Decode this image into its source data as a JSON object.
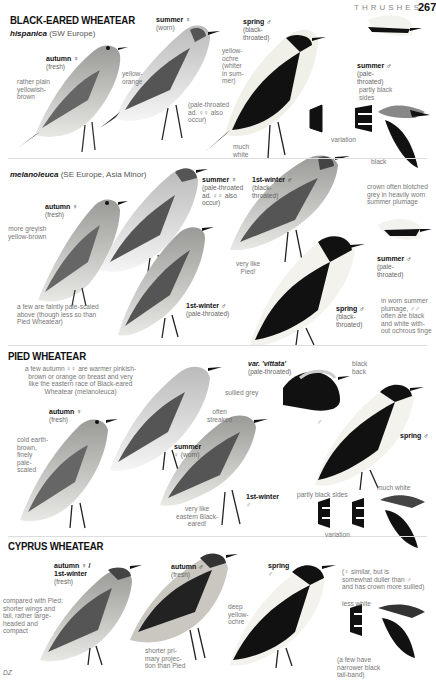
{
  "header": {
    "chapter": "THRUSHES",
    "page_number": "267"
  },
  "colors": {
    "text_dark": "#111111",
    "text_grey": "#777777",
    "female_symbol": "#cc7777",
    "rule": "#dddddd"
  },
  "sections": [
    {
      "title": "BLACK-EARED WHEATEAR",
      "races": [
        {
          "name": "hispanica",
          "range": "(SW Europe)",
          "labels": {
            "autumn_f": {
              "title": "autumn ♀",
              "sub": "(fresh)"
            },
            "summer_f": {
              "title": "summer ♀",
              "sub": "(worn)"
            },
            "spring_m": {
              "title": "spring ♂",
              "sub": "(black-\nthroated)"
            },
            "summer_m": {
              "title": "summer ♂",
              "sub": "(pale-\nthroated)"
            }
          },
          "notes": {
            "plain": "rather plain\nyellowish-\nbrown",
            "yellow_orange": "yellow-\norange",
            "pale_throated": "(pale-throated\nad. ♀♀ also\noccur)",
            "yellow_ochre": "yellow-\nochre\n(whiter\nin sum-\nmer)",
            "much_white": "much\nwhite",
            "partly_black": "partly black\nsides",
            "variation": "variation",
            "black": "black"
          }
        },
        {
          "name": "melanoleuca",
          "range": "(SE Europe, Asia Minor)",
          "labels": {
            "autumn_f": {
              "title": "autumn ♀",
              "sub": "(fresh)"
            },
            "summer_f": {
              "title": "summer ♀",
              "sub": "(pale-throated\nad. ♀♀ also\noccur)"
            },
            "first_winter_m": {
              "title": "1st-winter ♂",
              "sub": "(black-\nthroated)"
            },
            "first_winter_m2": {
              "title": "1st-winter ♂",
              "sub": "(pale-throated)"
            },
            "summer_m": {
              "title": "summer ♂",
              "sub": "(pale-\nthroated)"
            },
            "spring_m": {
              "title": "spring ♂",
              "sub": "(black-\nthroated)"
            }
          },
          "notes": {
            "greyish": "more greyish\nyellow-brown",
            "crown": "crown often blotched\ngrey in heavily worn\nsummer plumage",
            "very_like_pied": "very like\nPied!",
            "scaled": "a few are faintly pale-scaled\nabove (though less so than\nPied Wheatear)",
            "worn_summer": "in worn summer\nplumage, ♂♂\noften are black\nand white with-\nout ochrous tinge"
          }
        }
      ]
    },
    {
      "title": "PIED WHEATEAR",
      "labels": {
        "autumn_f": {
          "title": "autumn ♀",
          "sub": "(fresh)"
        },
        "summer_f": {
          "title": "summer",
          "sub": "♀ (worn)"
        },
        "vittata": {
          "title": "var. 'vittata'",
          "sub": "(pale-throated)"
        },
        "spring_m": {
          "title": "spring ♂",
          "sub": ""
        },
        "first_winter": {
          "title": "1st-winter",
          "sub": "♂"
        }
      },
      "notes": {
        "warmer": "a few autumn ♀♀ are warmer pinkish-\nbrown or orange on breast and very\nlike the eastern race of Black-eared\nWheatear (melanoleuca)",
        "cold": "cold earth-\nbrown,\nfinely\npale-\nscaled",
        "sullied": "sullied grey",
        "streaked": "often\nstreaked",
        "black_back": "black\nback",
        "male_symbol": "♂",
        "eastern": "very like\neastern Black-\neared!",
        "partly_black": "partly black sides",
        "variation": "variation",
        "much_white": "much white"
      }
    },
    {
      "title": "CYPRUS WHEATEAR",
      "labels": {
        "autumn_f": {
          "title": "autumn ♀ /\n1st-winter",
          "sub": "(fresh)"
        },
        "autumn_m": {
          "title": "autumn ♂",
          "sub": "(fresh)"
        },
        "spring_m": {
          "title": "spring",
          "sub": "♂"
        }
      },
      "notes": {
        "compared": "compared with Pied:\nshorter wings and\ntail, rather large-\nheaded and\ncompact",
        "deep": "deep\nyellow-\nochre",
        "shorter": "shorter pri-\nmary projec-\ntion than Pied",
        "female_similar": "(♀ similar, but is\nsomewhat duller than ♂\nand has crown more sullied)",
        "less_white": "less white",
        "narrower": "(a few have\nnarrower black\ntail-band)"
      }
    }
  ],
  "artist_signature": "DZ"
}
